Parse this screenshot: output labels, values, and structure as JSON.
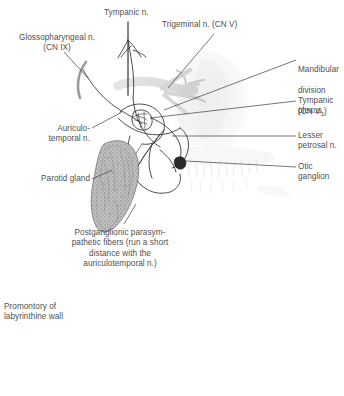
{
  "figure": {
    "width": 344,
    "height": 396,
    "background": "#ffffff",
    "text_color": "#4f4f4f",
    "line_color": "#3a3a3a",
    "gland_fill": "#b9b9b9",
    "bone_fill": "#e7e7e9"
  },
  "labels": {
    "tympanic_nerve": "Tympanic n.",
    "trigeminal_nerve": "Trigeminal n. (CN V)",
    "glossopharyngeal_nerve": "Glossopharyngeal n.\n(CN IX)",
    "mandibular_division_line1": "Mandibular",
    "mandibular_division_line2": "division",
    "mandibular_division_line3_pre": "(CN V",
    "mandibular_division_sub": "3",
    "mandibular_division_line3_post": ")",
    "tympanic_plexus": "Tympanic\nplexus",
    "auriculotemporal_nerve": "Auriculo-\ntemporal n.",
    "lesser_petrosal_nerve": "Lesser\npetrosal n.",
    "otic_ganglion": "Otic\nganglion",
    "parotid_gland": "Parotid gland",
    "postganglionic_fibers": "Postganglionic parasym-\npathetic fibers (run a short\ndistance with the\nauriculotemporal n.)",
    "promontory": "Promontory of\nlabyrinthine wall"
  }
}
